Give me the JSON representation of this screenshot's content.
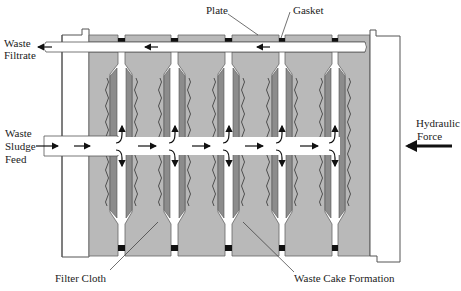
{
  "diagram": {
    "labels": {
      "plate": "Plate",
      "gasket": "Gasket",
      "waste_filtrate_1": "Waste",
      "waste_filtrate_2": "Filtrate",
      "waste_sludge_feed_1": "Waste",
      "waste_sludge_feed_2": "Sludge",
      "waste_sludge_feed_3": "Feed",
      "hydraulic_force_1": "Hydraulic",
      "hydraulic_force_2": "Force",
      "filter_cloth": "Filter Cloth",
      "waste_cake_formation": "Waste Cake Formation"
    },
    "colors": {
      "plate": "#b9b9b9",
      "cloth": "#8c8c8c",
      "gasket": "#111111",
      "frame": "#ffffff",
      "outline": "#555555",
      "arrow": "#111111"
    },
    "plate_count": 6,
    "gasket_count": 5
  }
}
